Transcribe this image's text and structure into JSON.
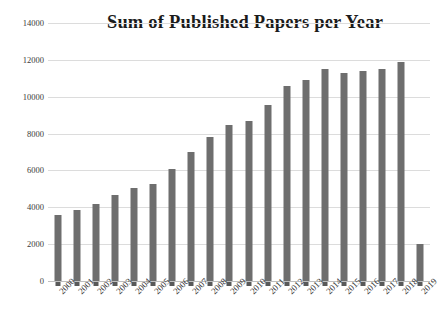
{
  "chart_data": {
    "type": "bar",
    "title": "Sum of Published Papers per Year",
    "xlabel": "",
    "ylabel": "",
    "ylim": [
      0,
      14000
    ],
    "ytick_step": 2000,
    "ytick_labels": [
      "0",
      "2000",
      "4000",
      "6000",
      "8000",
      "10000",
      "12000",
      "14000"
    ],
    "ytick_values": [
      0,
      2000,
      4000,
      6000,
      8000,
      10000,
      12000,
      14000
    ],
    "grid": true,
    "legend": "none",
    "bar_color": "#6e6e6e",
    "categories": [
      "2000",
      "2001",
      "2002",
      "2003",
      "2004",
      "2005",
      "2006",
      "2007",
      "2008",
      "2009",
      "2010",
      "2011",
      "2012",
      "2013",
      "2014",
      "2015",
      "2016",
      "2017",
      "2018",
      "2019"
    ],
    "values": [
      3580,
      3850,
      4180,
      4680,
      5050,
      5280,
      6080,
      7000,
      7820,
      8480,
      8680,
      9550,
      10580,
      10900,
      11480,
      11280,
      11400,
      11500,
      11870,
      2000
    ]
  },
  "axis": {
    "xtick_rotation_deg": -45
  }
}
